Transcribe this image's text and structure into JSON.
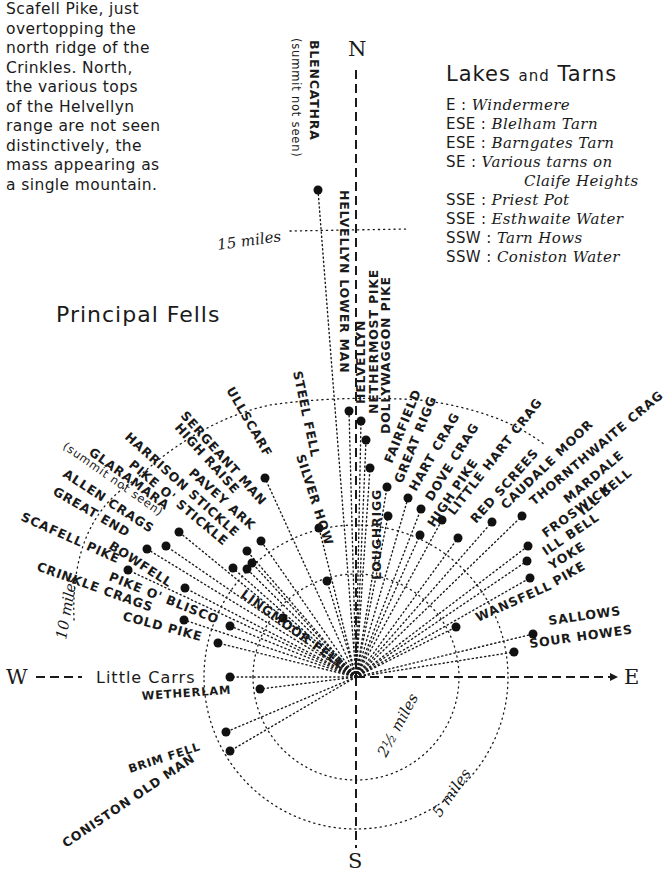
{
  "note": {
    "text": "Scafell Pike, just\novertopping the\nnorth ridge of the\nCrinkles.  North,\nthe various tops\nof the Helvellyn\nrange are not seen\ndistinctively, the\nmass appearing as\na single mountain."
  },
  "legend": {
    "title_main": "Lakes",
    "title_and": "and",
    "title_end": "Tarns",
    "rows": [
      {
        "dir": "E :",
        "lake": "Windermere"
      },
      {
        "dir": "ESE :",
        "lake": "Blelham Tarn"
      },
      {
        "dir": "ESE :",
        "lake": "Barngates Tarn"
      },
      {
        "dir": "SE :",
        "lake": "Various tarns on"
      },
      {
        "dir": "",
        "lake": "Claife Heights"
      },
      {
        "dir": "SSE :",
        "lake": "Priest Pot"
      },
      {
        "dir": "SSE :",
        "lake": "Esthwaite Water"
      },
      {
        "dir": "SSW :",
        "lake": "Tarn Hows"
      },
      {
        "dir": "SSW :",
        "lake": "Coniston Water"
      }
    ]
  },
  "section_title": "Principal Fells",
  "compass": {
    "n": "N",
    "s": "S",
    "e": "E",
    "w": "W"
  },
  "distances": {
    "d2_5": "2½ miles",
    "d5": "5 miles",
    "d10": "10 miles",
    "d15": "15 miles"
  },
  "fells": {
    "blencathra": "BLENCATHRA",
    "blencathra_note": "(summit not seen)",
    "helvellyn_lower_man": "HELVELLYN LOWER MAN",
    "helvellyn": "HELVELLYN",
    "nethermost_pike": "NETHERMOST PIKE",
    "dollywaggon_pike": "DOLLYWAGGON PIKE",
    "fairfield": "FAIRFIELD",
    "great_rigg": "GREAT RIGG",
    "hart_crag": "HART CRAG",
    "dove_crag": "DOVE CRAG",
    "high_pike": "HIGH PIKE",
    "little_hart_crag": "LITTLE HART CRAG",
    "red_screes": "RED SCREES",
    "caudale_moor": "CAUDALE MOOR",
    "thornthwaite_crag": "THORNTHWAITE CRAG",
    "mardale_ill_bell": "MARDALE",
    "ill_bell_a": "ILL BELL",
    "froswick": "FROSWICK",
    "ill_bell": "ILL BELL",
    "yoke": "YOKE",
    "pike": "PIKE",
    "wansfell": "WANSFELL",
    "sallows": "SALLOWS",
    "sour_howes": "SOUR HOWES",
    "loughrigg": "LOUGHRIGG",
    "steel_fell": "STEEL FELL",
    "silver_how": "SILVER HOW",
    "ullscarf": "ULLSCARF",
    "sergeant_man": "SERGEANT MAN",
    "high_raise": "HIGH RAISE",
    "harrison_stickle": "HARRISON STICKLE",
    "pavey_ark": "PAVEY ARK",
    "pike_o_stickle": "PIKE O' STICKLE",
    "glaramara": "GLARAMARA",
    "glaramara_note": "(summit not seen)",
    "allen_crags": "ALLEN CRAGS",
    "great_end": "GREAT END",
    "scafell_pike": "SCAFELL PIKE",
    "bowfell": "BOWFELL",
    "crinkle_crags": "CRINKLE CRAGS",
    "pike_o_blisco": "PIKE O' BLISCO",
    "cold_pike": "COLD PIKE",
    "lingmoor_fell": "LINGMOOR FELL",
    "little_carrs": "Little Carrs",
    "wetherlam": "WETHERLAM",
    "brim_fell": "BRIM FELL",
    "coniston_old_man": "CONISTON OLD MAN"
  }
}
